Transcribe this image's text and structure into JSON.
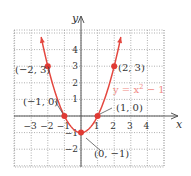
{
  "chart_data": {
    "type": "line",
    "title": "",
    "xlabel": "x",
    "ylabel": "y",
    "xlim": [
      -3.5,
      4.5
    ],
    "ylim": [
      -2.5,
      5
    ],
    "grid": true,
    "grid_style": "dotted",
    "x_ticks": [
      -3,
      -2,
      -1,
      1,
      2,
      3,
      4
    ],
    "x_tick_labels": [
      "−3",
      "−2",
      "−1",
      "1",
      "2",
      "3",
      "4"
    ],
    "y_ticks": [
      -2,
      -1,
      1,
      2,
      3,
      4
    ],
    "y_tick_labels": [
      "−2",
      "−1",
      "1",
      "2",
      "3",
      "4"
    ],
    "series": [
      {
        "name": "y = x² − 1",
        "function": "x^2 - 1",
        "domain": [
          -2.4,
          2.4
        ],
        "color": "#e4473f",
        "arrows_at_ends": true
      }
    ],
    "points": [
      {
        "x": -2,
        "y": 3,
        "label": "(−2, 3)"
      },
      {
        "x": 2,
        "y": 3,
        "label": "(2, 3)"
      },
      {
        "x": -1,
        "y": 0,
        "label": "(−1, 0)"
      },
      {
        "x": 1,
        "y": 0,
        "label": "(1, 0)"
      },
      {
        "x": 0,
        "y": -1,
        "label": "(0, −1)"
      }
    ],
    "annotations": [
      {
        "text": "y = x² − 1",
        "color": "#f08a84",
        "near": [
          1.6,
          1.7
        ]
      }
    ]
  },
  "colors": {
    "curve": "#e4473f",
    "point": "#e03a34",
    "equation": "#f08a84",
    "axis": "#555555",
    "grid": "#9a9a9a",
    "text": "#333333",
    "leader": "#555555"
  },
  "axes": {
    "x_label": "x",
    "y_label": "y"
  },
  "equation_label": {
    "base": "y = x",
    "exp": "2",
    "tail": " − 1"
  }
}
